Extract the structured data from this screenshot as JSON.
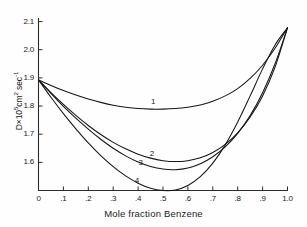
{
  "chart_data": {
    "type": "line",
    "title": "",
    "xlabel": "Mole fraction Benzene",
    "ylabel_parts": {
      "base": "D",
      "times": "×",
      "ten": "10",
      "exp": "5",
      "units": "cm",
      "units_exp": "2",
      "sec": "sec",
      "sec_exp": "-1"
    },
    "ylabel": "D×10⁵ cm² sec⁻¹",
    "xlim": [
      0,
      1.0
    ],
    "ylim": [
      1.5,
      2.15
    ],
    "grid": false,
    "legend_position": "inline-curve-labels",
    "xticks": [
      0,
      0.1,
      0.2,
      0.3,
      0.4,
      0.5,
      0.6,
      0.7,
      0.8,
      0.9,
      1.0
    ],
    "xticklabels": [
      "0",
      ".1",
      ".2",
      ".3",
      ".4",
      ".5",
      ".6",
      ".7",
      ".8",
      ".9",
      "1.0"
    ],
    "yticks": [
      1.6,
      1.7,
      1.8,
      1.9,
      2.0,
      2.1
    ],
    "yticklabels": [
      "1.6",
      "1.7",
      "1.8",
      "1.9",
      "2.0",
      "2.1"
    ],
    "x": [
      0,
      0.05,
      0.1,
      0.15,
      0.2,
      0.25,
      0.3,
      0.35,
      0.4,
      0.45,
      0.5,
      0.55,
      0.6,
      0.65,
      0.7,
      0.75,
      0.8,
      0.85,
      0.9,
      0.95,
      1.0
    ],
    "series": [
      {
        "name": "1",
        "label": "1",
        "label_x": 0.46,
        "label_y": 1.815,
        "values": [
          1.893,
          1.873,
          1.855,
          1.839,
          1.825,
          1.813,
          1.803,
          1.796,
          1.791,
          1.789,
          1.789,
          1.791,
          1.796,
          1.804,
          1.817,
          1.836,
          1.862,
          1.898,
          1.945,
          2.005,
          2.078
        ]
      },
      {
        "name": "2",
        "label": "2",
        "label_x": 0.455,
        "label_y": 1.628,
        "values": [
          1.893,
          1.848,
          1.806,
          1.767,
          1.731,
          1.699,
          1.671,
          1.648,
          1.629,
          1.615,
          1.606,
          1.603,
          1.606,
          1.616,
          1.635,
          1.664,
          1.705,
          1.761,
          1.836,
          1.938,
          2.078
        ]
      },
      {
        "name": "3",
        "label": "3",
        "label_x": 0.41,
        "label_y": 1.598,
        "values": [
          1.893,
          1.845,
          1.799,
          1.757,
          1.718,
          1.682,
          1.65,
          1.623,
          1.601,
          1.585,
          1.576,
          1.574,
          1.58,
          1.595,
          1.62,
          1.655,
          1.703,
          1.766,
          1.847,
          1.95,
          2.078
        ]
      },
      {
        "name": "4",
        "label": "4",
        "label_x": 0.395,
        "label_y": 1.535,
        "values": [
          1.893,
          1.831,
          1.773,
          1.719,
          1.669,
          1.624,
          1.585,
          1.552,
          1.526,
          1.508,
          1.5,
          1.502,
          1.518,
          1.549,
          1.597,
          1.662,
          1.743,
          1.836,
          1.932,
          2.017,
          2.078
        ]
      }
    ]
  },
  "axes": {
    "y_title_text": "D×10⁵cm² sec⁻¹",
    "x_title_text": "Mole fraction Benzene"
  }
}
